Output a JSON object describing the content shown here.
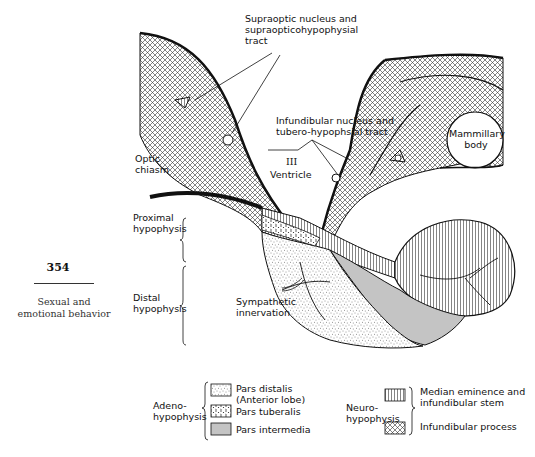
{
  "figure": {
    "labels": {
      "supraoptic": "Supraoptic nucleus and\nsupraopticohypophysial\ntract",
      "infundibular_nucleus": "Infundibular nucleus and\ntubero-hypophsial tract",
      "mammillary_body": "Mammillary\nbody",
      "optic_chiasm": "Optic\nchiasm",
      "third_ventricle_numeral": "III",
      "third_ventricle": "Ventricle",
      "proximal_hypophysis": "Proximal\nhypophysis",
      "distal_hypophysis": "Distal\nhypophysis",
      "sympathetic_innervation": "Sympathetic\ninnervation"
    },
    "legend": {
      "adeno_group": "Adeno-\nhypophysis",
      "neuro_group": "Neuro-\nhypophysis",
      "adeno_items": [
        {
          "label": "Pars distalis\n(Anterior lobe)",
          "pattern": "stipple"
        },
        {
          "label": "Pars tuberalis",
          "pattern": "coarse-stipple"
        },
        {
          "label": "Pars intermedia",
          "pattern": "gray-fill"
        }
      ],
      "neuro_items": [
        {
          "label": "Median eminence and\ninfundibular stem",
          "pattern": "vertical-lines"
        },
        {
          "label": "Infundibular process",
          "pattern": "crosshatch"
        }
      ]
    },
    "colors": {
      "ink": "#111111",
      "intermedia_gray": "#c4c4c4",
      "background": "#ffffff"
    }
  },
  "page": {
    "number": "354",
    "caption": "Sexual and\nemotional behavior"
  }
}
